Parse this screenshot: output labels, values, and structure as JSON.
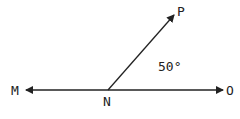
{
  "diagram": {
    "type": "angle",
    "points": {
      "M": {
        "label": "M"
      },
      "N": {
        "label": "N"
      },
      "O": {
        "label": "O"
      },
      "P": {
        "label": "P"
      }
    },
    "angle_label": "50°",
    "angle_between": [
      "NO",
      "NP"
    ],
    "line_color": "#222222"
  }
}
